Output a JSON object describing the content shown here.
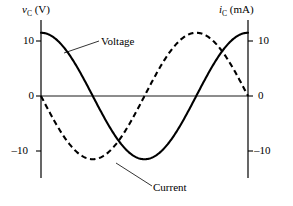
{
  "figure": {
    "background_color": "#ffffff",
    "line_color": "#000000"
  },
  "axes": {
    "left": {
      "title_symbol": "v",
      "title_subscript": "C",
      "title_unit": "(V)",
      "title_full": "v_C (V)",
      "ticks": [
        "10",
        "0",
        "–10"
      ],
      "tick_values": [
        10,
        0,
        -10
      ]
    },
    "right": {
      "title_symbol": "i",
      "title_subscript": "C",
      "title_unit": "(mA)",
      "title_full": "i_C (mA)",
      "ticks": [
        "10",
        "0",
        "–10"
      ],
      "tick_values": [
        10,
        0,
        -10
      ]
    }
  },
  "labels": {
    "voltage": "Voltage",
    "current": "Current"
  },
  "chart_data": {
    "type": "line",
    "title": "",
    "subtitle": "",
    "xlabel": "",
    "ylabel": "v_C (V)",
    "y2label": "i_C (mA)",
    "xlim": [
      0,
      360
    ],
    "ylim": [
      -12.7,
      14.0
    ],
    "y2lim": [
      -12.7,
      14.0
    ],
    "grid": false,
    "legend_position": "inline-annotation",
    "x_axis_visible": false,
    "zero_line": true,
    "x_tick_labels": [],
    "y_tick_labels": [
      "10",
      "0",
      "–10"
    ],
    "y_tick_values": [
      10,
      0,
      -10
    ],
    "y2_tick_labels": [
      "10",
      "0",
      "–10"
    ],
    "y2_tick_values": [
      10,
      0,
      -10
    ],
    "x": [
      0,
      15,
      30,
      45,
      60,
      75,
      90,
      105,
      120,
      135,
      150,
      165,
      180,
      195,
      210,
      225,
      240,
      255,
      270,
      285,
      300,
      315,
      330,
      345,
      360
    ],
    "series": [
      {
        "name": "Voltage",
        "unit": "V",
        "style": "solid",
        "color": "#000000",
        "amplitude": 11.5,
        "phase": "cosine",
        "equation": "v_C = 11.5 cos(x)",
        "values": [
          11.5,
          11.11,
          9.96,
          8.13,
          5.75,
          2.98,
          0.0,
          -2.98,
          -5.75,
          -8.13,
          -9.96,
          -11.11,
          -11.5,
          -11.11,
          -9.96,
          -8.13,
          -5.75,
          -2.98,
          0.0,
          2.98,
          5.75,
          8.13,
          9.96,
          11.11,
          11.5
        ]
      },
      {
        "name": "Current",
        "unit": "mA",
        "style": "dashed",
        "color": "#000000",
        "amplitude": 11.5,
        "phase": "negative-sine",
        "equation": "i_C = -11.5 sin(x)",
        "values": [
          0.0,
          -2.98,
          -5.75,
          -8.13,
          -9.96,
          -11.11,
          -11.5,
          -11.11,
          -9.96,
          -8.13,
          -5.75,
          -2.98,
          0.0,
          2.98,
          5.75,
          8.13,
          9.96,
          11.11,
          11.5,
          11.11,
          9.96,
          8.13,
          5.75,
          2.98,
          0.0
        ]
      }
    ],
    "annotations": [
      {
        "text": "Voltage",
        "points_to": "Voltage"
      },
      {
        "text": "Current",
        "points_to": "Current"
      }
    ]
  }
}
